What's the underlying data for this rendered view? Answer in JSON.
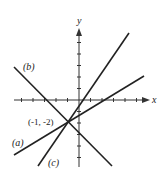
{
  "diagram": {
    "type": "coordinate-plane-lines",
    "axes": {
      "x_label": "x",
      "y_label": "y",
      "color": "#333333"
    },
    "lines": [
      {
        "id": "a",
        "label": "(a)",
        "through": [
          -1,
          -2
        ],
        "slope": 0.6
      },
      {
        "id": "b",
        "label": "(b)",
        "through": [
          -1,
          -2
        ],
        "slope": -1
      },
      {
        "id": "c",
        "label": "(c)",
        "through": [
          -1,
          -2
        ],
        "slope": 1.5
      }
    ],
    "intersection": {
      "label": "(-1, -2)",
      "x": -1,
      "y": -2
    },
    "line_color": "#222222"
  }
}
